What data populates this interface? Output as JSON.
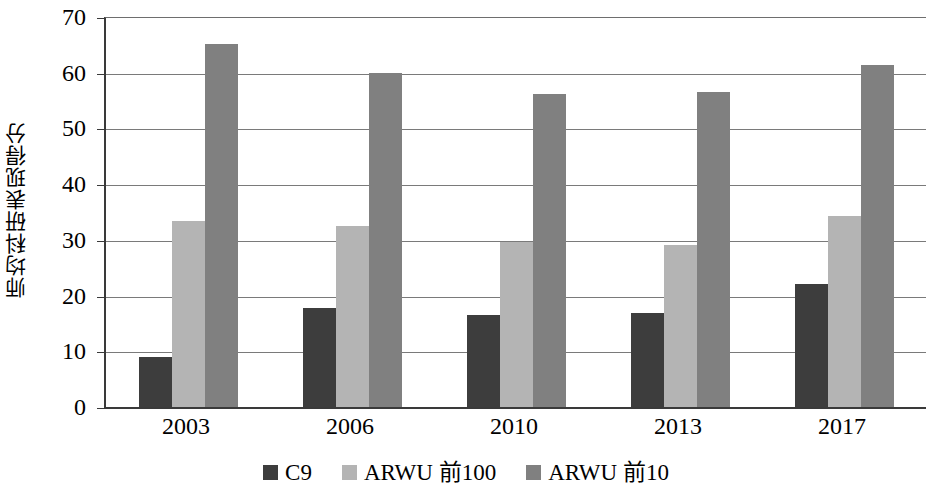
{
  "chart_data": {
    "type": "bar",
    "title": "",
    "subtitle": "",
    "xlabel": "",
    "ylabel": "师均科研表现得分",
    "categories": [
      "2003",
      "2006",
      "2010",
      "2013",
      "2017"
    ],
    "series": [
      {
        "name": "C9",
        "color": "#3d3d3d",
        "values": [
          9.2,
          18.0,
          16.7,
          17.0,
          22.3
        ]
      },
      {
        "name": "ARWU 前100",
        "color": "#b4b4b4",
        "values": [
          33.6,
          32.7,
          29.8,
          29.3,
          34.5
        ]
      },
      {
        "name": "ARWU 前10",
        "color": "#808080",
        "values": [
          65.3,
          60.2,
          56.3,
          56.8,
          61.5
        ]
      }
    ],
    "ylim": [
      0,
      70
    ],
    "ytick_values": [
      0,
      10,
      20,
      30,
      40,
      50,
      60,
      70
    ],
    "ytick_labels": [
      "0",
      "10",
      "20",
      "30",
      "40",
      "50",
      "60",
      "70"
    ],
    "grid": true,
    "grid_axis": "y",
    "legend_position": "bottom",
    "legend_entries": [
      "C9",
      "ARWU 前100",
      "ARWU 前10"
    ]
  }
}
